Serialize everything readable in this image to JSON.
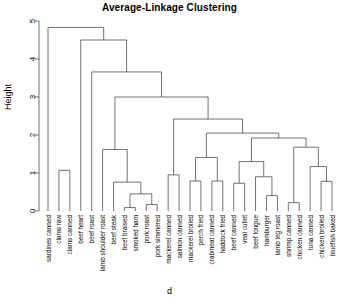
{
  "chart_data": {
    "type": "dendrogram",
    "title": "Average-Linkage Clustering",
    "xlabel": "d",
    "ylabel": "Height",
    "ylim": [
      0,
      5
    ],
    "yticks": [
      0,
      1,
      2,
      3,
      4,
      5
    ],
    "grid": false,
    "legend": null,
    "leaves": [
      "sardines canned",
      "clams raw",
      "clams canned",
      "beef heart",
      "beef roast",
      "lamb shoulder roast",
      "beef steak",
      "beef braised",
      "smoked ham",
      "pork roast",
      "pork simmered",
      "mackerel canned",
      "salmon canned",
      "mackerel broiled",
      "perch fried",
      "crabmeat canned",
      "haddock fried",
      "beef canned",
      "veal cutlet",
      "beef tongue",
      "hamburger",
      "lamb leg roast",
      "shrimp canned",
      "chicken canned",
      "tuna canned",
      "chicken broiled",
      "bluefish baked"
    ],
    "merges": [
      {
        "id": "m1",
        "left": {
          "leaf": 1
        },
        "right": {
          "leaf": 2
        },
        "height": 1.07
      },
      {
        "id": "m2",
        "left": {
          "leaf": 7
        },
        "right": {
          "leaf": 8
        },
        "height": 0.09
      },
      {
        "id": "m3",
        "left": {
          "leaf": 9
        },
        "right": {
          "leaf": 10
        },
        "height": 0.17
      },
      {
        "id": "m4",
        "left": {
          "node": "m2"
        },
        "right": {
          "node": "m3"
        },
        "height": 0.45
      },
      {
        "id": "m5",
        "left": {
          "leaf": 6
        },
        "right": {
          "node": "m4"
        },
        "height": 0.76
      },
      {
        "id": "m6",
        "left": {
          "leaf": 5
        },
        "right": {
          "node": "m5"
        },
        "height": 1.62
      },
      {
        "id": "m7",
        "left": {
          "leaf": 11
        },
        "right": {
          "leaf": 12
        },
        "height": 0.95
      },
      {
        "id": "m8",
        "left": {
          "leaf": 13
        },
        "right": {
          "leaf": 14
        },
        "height": 0.79
      },
      {
        "id": "m9",
        "left": {
          "leaf": 15
        },
        "right": {
          "leaf": 16
        },
        "height": 0.79
      },
      {
        "id": "m10",
        "left": {
          "node": "m8"
        },
        "right": {
          "node": "m9"
        },
        "height": 1.41
      },
      {
        "id": "m11",
        "left": {
          "leaf": 17
        },
        "right": {
          "leaf": 18
        },
        "height": 0.73
      },
      {
        "id": "m12",
        "left": {
          "leaf": 20
        },
        "right": {
          "leaf": 21
        },
        "height": 0.41
      },
      {
        "id": "m13",
        "left": {
          "leaf": 19
        },
        "right": {
          "node": "m12"
        },
        "height": 0.9
      },
      {
        "id": "m14",
        "left": {
          "node": "m11"
        },
        "right": {
          "node": "m13"
        },
        "height": 1.3
      },
      {
        "id": "m15",
        "left": {
          "leaf": 22
        },
        "right": {
          "leaf": 23
        },
        "height": 0.22
      },
      {
        "id": "m16",
        "left": {
          "leaf": 25
        },
        "right": {
          "leaf": 26
        },
        "height": 0.78
      },
      {
        "id": "m17",
        "left": {
          "leaf": 24
        },
        "right": {
          "node": "m16"
        },
        "height": 1.17
      },
      {
        "id": "m18",
        "left": {
          "node": "m15"
        },
        "right": {
          "node": "m17"
        },
        "height": 1.68
      },
      {
        "id": "m19",
        "left": {
          "node": "m14"
        },
        "right": {
          "node": "m18"
        },
        "height": 1.92
      },
      {
        "id": "m20",
        "left": {
          "node": "m10"
        },
        "right": {
          "node": "m19"
        },
        "height": 2.05
      },
      {
        "id": "m21",
        "left": {
          "node": "m7"
        },
        "right": {
          "node": "m20"
        },
        "height": 2.42
      },
      {
        "id": "m22",
        "left": {
          "node": "m6"
        },
        "right": {
          "node": "m21"
        },
        "height": 3.0
      },
      {
        "id": "m23",
        "left": {
          "leaf": 4
        },
        "right": {
          "node": "m22"
        },
        "height": 3.66
      },
      {
        "id": "m24",
        "left": {
          "leaf": 3
        },
        "right": {
          "node": "m23"
        },
        "height": 4.5
      },
      {
        "id": "m25",
        "left": {
          "leaf": 0
        },
        "right": {
          "node": "m24"
        },
        "height": 4.83
      }
    ]
  }
}
